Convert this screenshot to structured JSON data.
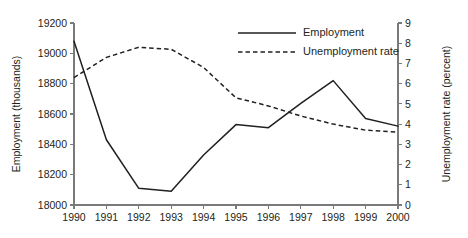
{
  "chart_data": {
    "type": "line",
    "title": "",
    "subtitle": "",
    "xlabel": "",
    "ylabel": "Employment (thousands)",
    "y2label": "Unemployment rate (percent)",
    "grid": false,
    "legend_position": "top-right",
    "x": [
      1990,
      1991,
      1992,
      1993,
      1994,
      1995,
      1996,
      1997,
      1998,
      1999,
      2000
    ],
    "categories": [
      "1990",
      "1991",
      "1992",
      "1993",
      "1994",
      "1995",
      "1996",
      "1997",
      "1998",
      "1999",
      "2000"
    ],
    "xlim": [
      1990,
      2000
    ],
    "ylim": [
      18000,
      19200
    ],
    "y2lim": [
      0,
      9
    ],
    "yticks": [
      18000,
      18200,
      18400,
      18600,
      18800,
      19000,
      19200
    ],
    "ytick_labels": [
      "18000",
      "18200",
      "18400",
      "18600",
      "18800",
      "19000",
      "19200"
    ],
    "y2ticks": [
      0,
      1,
      2,
      3,
      4,
      5,
      6,
      7,
      8,
      9
    ],
    "y2tick_labels": [
      "0",
      "1",
      "2",
      "3",
      "4",
      "5",
      "6",
      "7",
      "8",
      "9"
    ],
    "series": [
      {
        "name": "Employment",
        "axis": "left",
        "style": "solid",
        "color": "#231f20",
        "values": [
          19080,
          18430,
          18110,
          18090,
          18330,
          18530,
          18510,
          18670,
          18820,
          18570,
          18520
        ]
      },
      {
        "name": "Unemployment rate",
        "axis": "right",
        "style": "dashed",
        "color": "#231f20",
        "values": [
          6.3,
          7.3,
          7.8,
          7.7,
          6.8,
          5.3,
          4.9,
          4.4,
          4.0,
          3.7,
          3.6
        ]
      }
    ],
    "legend": [
      {
        "label": "Employment",
        "style": "solid"
      },
      {
        "label": "Unemployment rate",
        "style": "dashed"
      }
    ]
  }
}
